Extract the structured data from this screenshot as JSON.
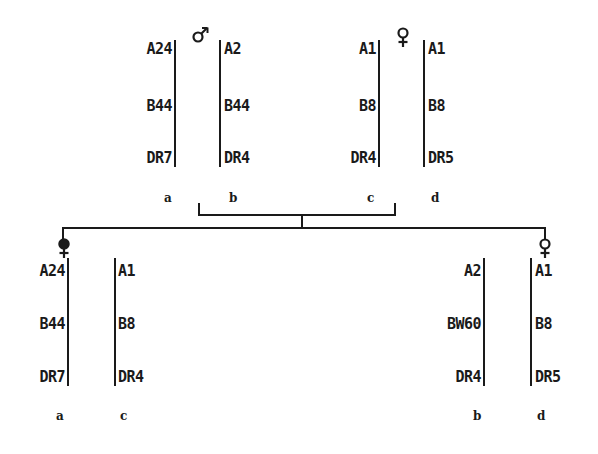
{
  "parents": {
    "father": {
      "symbol": "male",
      "haplotypes": [
        {
          "label": "a",
          "alleles": [
            "A24",
            "B44",
            "DR7"
          ]
        },
        {
          "label": "b",
          "alleles": [
            "A2",
            "B44",
            "DR4"
          ]
        }
      ]
    },
    "mother": {
      "symbol": "female",
      "haplotypes": [
        {
          "label": "c",
          "alleles": [
            "A1",
            "B8",
            "DR4"
          ]
        },
        {
          "label": "d",
          "alleles": [
            "A1",
            "B8",
            "DR5"
          ]
        }
      ]
    }
  },
  "children": [
    {
      "symbol": "female-affected",
      "haplotypes": [
        {
          "label": "a",
          "alleles": [
            "A24",
            "B44",
            "DR7"
          ]
        },
        {
          "label": "c",
          "alleles": [
            "A1",
            "B8",
            "DR4"
          ]
        }
      ]
    },
    {
      "symbol": "female",
      "haplotypes": [
        {
          "label": "b",
          "alleles": [
            "A2",
            "BW60",
            "DR4"
          ]
        },
        {
          "label": "d",
          "alleles": [
            "A1",
            "B8",
            "DR5"
          ]
        }
      ]
    }
  ]
}
